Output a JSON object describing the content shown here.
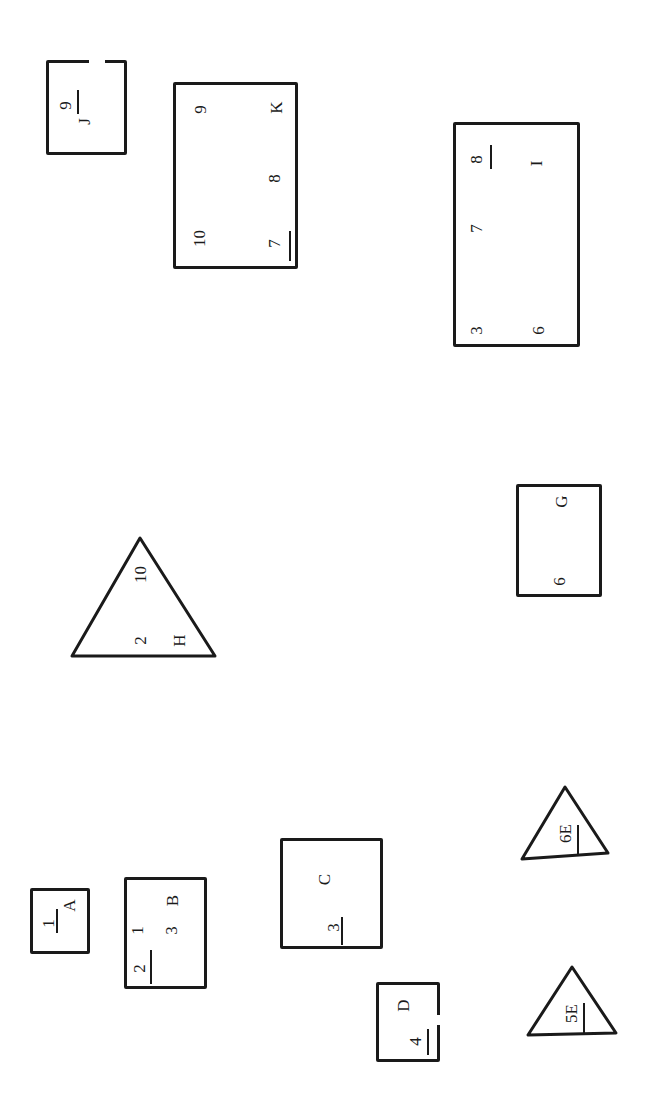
{
  "shapes": {
    "J": {
      "type": "rect",
      "labels": [
        "9",
        "J"
      ]
    },
    "K": {
      "type": "rect",
      "labels": [
        "9",
        "K",
        "10",
        "8",
        "7"
      ]
    },
    "I": {
      "type": "rect",
      "labels": [
        "8",
        "I",
        "7",
        "3",
        "6"
      ]
    },
    "H": {
      "type": "triangle",
      "labels": [
        "10",
        "2",
        "H"
      ]
    },
    "G": {
      "type": "rect",
      "labels": [
        "G",
        "6"
      ]
    },
    "A": {
      "type": "rect",
      "labels": [
        "1",
        "A"
      ]
    },
    "B": {
      "type": "rect",
      "labels": [
        "B",
        "1",
        "3",
        "2"
      ]
    },
    "C": {
      "type": "rect",
      "labels": [
        "C",
        "3"
      ]
    },
    "D": {
      "type": "rect",
      "labels": [
        "D",
        "4"
      ]
    },
    "E6": {
      "type": "triangle",
      "labels": [
        "6E"
      ]
    },
    "E5": {
      "type": "triangle",
      "labels": [
        "5E"
      ]
    }
  }
}
